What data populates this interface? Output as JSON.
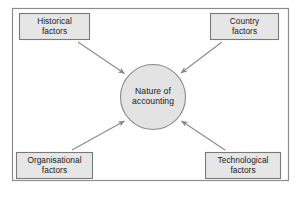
{
  "diagram": {
    "title_text": "",
    "frame": {
      "border_color": "#8d8d8d",
      "background": "#ffffff"
    },
    "style": {
      "box_fill": "#e6e6e6",
      "box_border": "#7a7a7a",
      "circle_fill": "#e3e3e3",
      "circle_border": "#8a8a8a",
      "arrow_color": "#8a8a8a",
      "text_color": "#1a1a1a"
    },
    "hub": {
      "label": "Nature of\naccounting",
      "line1": "Nature of",
      "line2": "accounting",
      "shape": "circle"
    },
    "nodes": [
      {
        "id": "historical",
        "label": "Historical\nfactors",
        "line1": "Historical",
        "line2": "factors",
        "position": "top-left",
        "shape": "rectangle"
      },
      {
        "id": "country",
        "label": "Country\nfactors",
        "line1": "Country",
        "line2": "factors",
        "position": "top-right",
        "shape": "rectangle"
      },
      {
        "id": "organisational",
        "label": "Organisational\nfactors",
        "line1": "Organisational",
        "line2": "factors",
        "position": "bottom-left",
        "shape": "rectangle"
      },
      {
        "id": "technological",
        "label": "Technological\nfactors",
        "line1": "Technological",
        "line2": "factors",
        "position": "bottom-right",
        "shape": "rectangle"
      }
    ],
    "edges": [
      {
        "from": "historical",
        "to": "hub",
        "arrowhead": "filled-triangle",
        "direction": "inward"
      },
      {
        "from": "country",
        "to": "hub",
        "arrowhead": "filled-triangle",
        "direction": "inward"
      },
      {
        "from": "organisational",
        "to": "hub",
        "arrowhead": "filled-triangle",
        "direction": "inward"
      },
      {
        "from": "technological",
        "to": "hub",
        "arrowhead": "filled-triangle",
        "direction": "inward"
      }
    ]
  }
}
